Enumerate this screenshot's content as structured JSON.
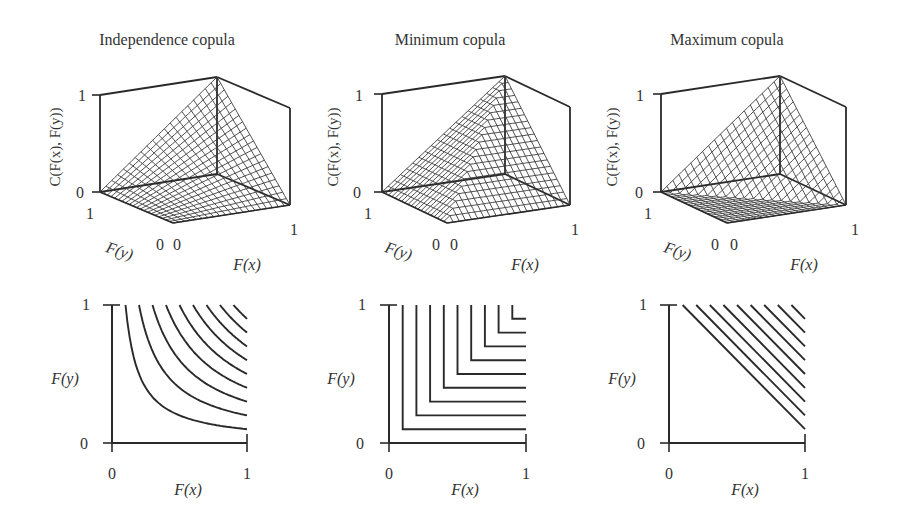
{
  "chart_data": [
    {
      "type": "surface3d",
      "title": "Independence copula",
      "copula": "independence",
      "formula": "C(u,v) = u*v",
      "xlabel": "F(x)",
      "ylabel": "F(y)",
      "zlabel": "C(F(x), F(y))",
      "x_ticks": [
        "0",
        "1"
      ],
      "y_ticks": [
        "1",
        "0"
      ],
      "z_ticks": [
        "0",
        "1"
      ],
      "xlim": [
        0,
        1
      ],
      "ylim": [
        0,
        1
      ],
      "zlim": [
        0,
        1
      ],
      "grid_resolution": 20
    },
    {
      "type": "surface3d",
      "title": "Minimum copula",
      "copula": "minimum",
      "formula": "C(u,v) = min(u,v)",
      "xlabel": "F(x)",
      "ylabel": "F(y)",
      "zlabel": "C(F(x), F(y))",
      "x_ticks": [
        "0",
        "1"
      ],
      "y_ticks": [
        "1",
        "0"
      ],
      "z_ticks": [
        "0",
        "1"
      ],
      "xlim": [
        0,
        1
      ],
      "ylim": [
        0,
        1
      ],
      "zlim": [
        0,
        1
      ],
      "grid_resolution": 20
    },
    {
      "type": "surface3d",
      "title": "Maximum copula",
      "copula": "maximum",
      "formula": "C(u,v) = max(u+v-1, 0)",
      "xlabel": "F(x)",
      "ylabel": "F(y)",
      "zlabel": "C(F(x), F(y))",
      "x_ticks": [
        "0",
        "1"
      ],
      "y_ticks": [
        "1",
        "0"
      ],
      "z_ticks": [
        "0",
        "1"
      ],
      "xlim": [
        0,
        1
      ],
      "ylim": [
        0,
        1
      ],
      "zlim": [
        0,
        1
      ],
      "grid_resolution": 20
    },
    {
      "type": "contour",
      "copula": "independence",
      "xlabel": "F(x)",
      "ylabel": "F(y)",
      "x_ticks": [
        "0",
        "1"
      ],
      "y_ticks": [
        "0",
        "1"
      ],
      "xlim": [
        0,
        1
      ],
      "ylim": [
        0,
        1
      ],
      "levels": [
        0.1,
        0.2,
        0.3,
        0.4,
        0.5,
        0.6,
        0.7,
        0.8,
        0.9
      ]
    },
    {
      "type": "contour",
      "copula": "minimum",
      "xlabel": "F(x)",
      "ylabel": "F(y)",
      "x_ticks": [
        "0",
        "1"
      ],
      "y_ticks": [
        "0",
        "1"
      ],
      "xlim": [
        0,
        1
      ],
      "ylim": [
        0,
        1
      ],
      "levels": [
        0.1,
        0.2,
        0.3,
        0.4,
        0.5,
        0.6,
        0.7,
        0.8,
        0.9
      ]
    },
    {
      "type": "contour",
      "copula": "maximum",
      "xlabel": "F(x)",
      "ylabel": "F(y)",
      "x_ticks": [
        "0",
        "1"
      ],
      "y_ticks": [
        "0",
        "1"
      ],
      "xlim": [
        0,
        1
      ],
      "ylim": [
        0,
        1
      ],
      "levels": [
        0.1,
        0.2,
        0.3,
        0.4,
        0.5,
        0.6,
        0.7,
        0.8,
        0.9
      ]
    }
  ],
  "panels": {
    "titles": [
      "Independence copula",
      "Minimum copula",
      "Maximum copula"
    ],
    "zlabel": "C(F(x), F(y))",
    "xlabel": "F(x)",
    "ylabel": "F(y)",
    "tick_zero": "0",
    "tick_one": "1"
  },
  "colors": {
    "line": "#2a2a2a",
    "mesh": "#3a3a3a",
    "text": "#333333",
    "background": "#ffffff"
  }
}
